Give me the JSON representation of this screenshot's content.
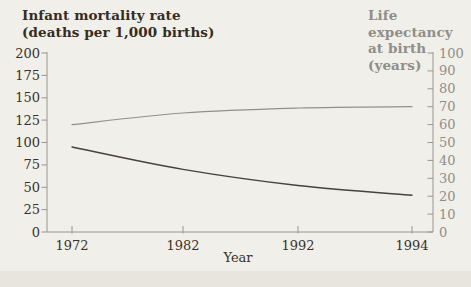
{
  "chart": {
    "left_axis_title": {
      "line1": "Infant mortality rate",
      "line2": "(deaths per 1,000 births)"
    },
    "right_axis_title": {
      "line1": "Life expectancy",
      "line2": "at birth (years)"
    }
  },
  "chart_data": {
    "type": "line",
    "categories": [
      "1972",
      "1982",
      "1992",
      "1994"
    ],
    "xlabel": "Year",
    "x_axis_note": "categories are evenly spaced on the axis",
    "left_axis": {
      "label": "Infant mortality rate (deaths per 1,000 births)",
      "range": [
        0,
        200
      ],
      "ticks": [
        0,
        25,
        50,
        75,
        100,
        125,
        150,
        175,
        200
      ]
    },
    "right_axis": {
      "label": "Life expectancy at birth (years)",
      "range": [
        0,
        100
      ],
      "ticks": [
        0,
        10,
        20,
        30,
        40,
        50,
        60,
        70,
        80,
        90,
        100
      ]
    },
    "series": [
      {
        "name": "Infant mortality rate",
        "axis": "left",
        "color": "#46423c",
        "values": [
          95,
          70,
          52,
          41
        ]
      },
      {
        "name": "Life expectancy at birth",
        "axis": "right",
        "color": "#91908c",
        "values": [
          60,
          66.5,
          69.3,
          70
        ]
      }
    ],
    "grid": false,
    "legend": "none"
  },
  "colors": {
    "background": "#f1efe9",
    "bottom_strip": "#e8e5df",
    "axis_line": "#98968f",
    "dark_text": "#3a3129",
    "gray_text": "#8f8e8a"
  }
}
